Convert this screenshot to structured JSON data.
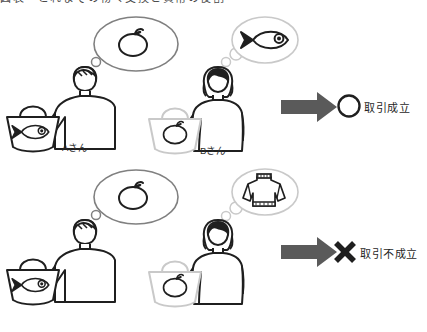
{
  "page": {
    "title_remnant": "図表　これまでの物々交換と貨幣の役割",
    "background_color": "#ffffff"
  },
  "colors": {
    "dark_outline": "#1f1f1f",
    "light_outline": "#c9c9c9",
    "bubble_outline": "#808080",
    "arrow_fill": "#5a5a5a",
    "text": "#1f1f1f"
  },
  "rows": [
    {
      "id": "row-success",
      "left_person": {
        "name_label": "Aさん",
        "gender_icon": "man-icon",
        "wants_icon": "apple-icon",
        "has_icon": "fish-icon",
        "bag_icon": "shopping-bag-icon",
        "bubble_icon": "thought-bubble-icon"
      },
      "right_person": {
        "name_label": "Bさん",
        "gender_icon": "woman-icon",
        "wants_icon": "fish-icon",
        "has_icon": "apple-icon",
        "bag_icon": "shopping-bag-icon",
        "bubble_icon": "thought-bubble-icon"
      },
      "arrow_icon": "right-arrow-icon",
      "result_mark_icon": "circle-mark-icon",
      "result_label": "取引成立"
    },
    {
      "id": "row-failure",
      "left_person": {
        "name_label": "",
        "gender_icon": "man-icon",
        "wants_icon": "apple-icon",
        "has_icon": "fish-icon",
        "bag_icon": "shopping-bag-icon",
        "bubble_icon": "thought-bubble-icon"
      },
      "right_person": {
        "name_label": "",
        "gender_icon": "woman-icon",
        "wants_icon": "sweater-icon",
        "has_icon": "apple-icon",
        "bag_icon": "shopping-bag-icon",
        "bubble_icon": "thought-bubble-icon"
      },
      "arrow_icon": "right-arrow-icon",
      "result_mark_icon": "cross-mark-icon",
      "result_label": "取引不成立"
    }
  ]
}
